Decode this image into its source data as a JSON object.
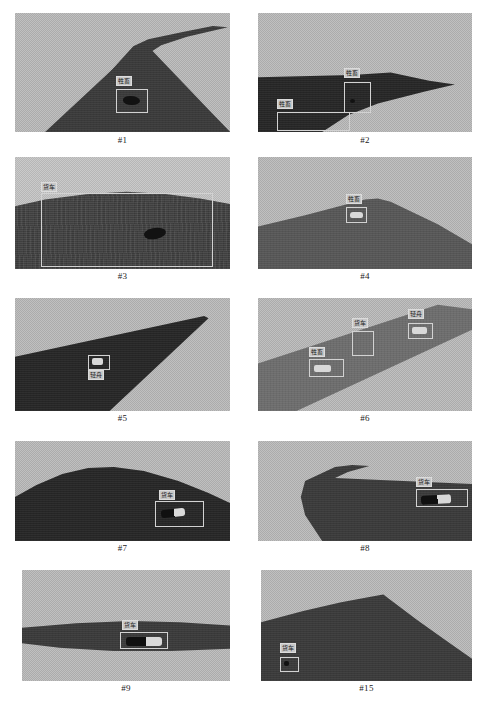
{
  "figure": {
    "columns": 2,
    "rows": 5,
    "label_classes": {
      "livestock": "牲畜",
      "truck": "货车",
      "light_boat": "轻舟"
    }
  },
  "panels": [
    {
      "id": "p1",
      "caption": "#1",
      "scene": "dark ridge silhouette against dithered gray sky",
      "detections": [
        {
          "label": "牲畜",
          "class": "livestock"
        }
      ]
    },
    {
      "id": "p2",
      "caption": "#2",
      "scene": "dark wedge-shaped landmass with pointed tip, gray sky",
      "detections": [
        {
          "label": "牲畜",
          "class": "livestock"
        },
        {
          "label": "牲畜",
          "class": "livestock"
        }
      ]
    },
    {
      "id": "p3",
      "caption": "#3",
      "scene": "textured water / rough dark field below a low horizon",
      "detections": [
        {
          "label": "货车",
          "class": "truck"
        }
      ]
    },
    {
      "id": "p4",
      "caption": "#4",
      "scene": "broad dark slope rising to a peak, light sky",
      "detections": [
        {
          "label": "牲畜",
          "class": "livestock"
        }
      ]
    },
    {
      "id": "p5",
      "caption": "#5",
      "scene": "long dark triangular wedge pointing to upper right",
      "detections": [
        {
          "label": "轻舟",
          "class": "light_boat"
        }
      ]
    },
    {
      "id": "p6",
      "caption": "#6",
      "scene": "diagonal gray band (road) crossing the frame",
      "detections": [
        {
          "label": "轻舟",
          "class": "light_boat"
        },
        {
          "label": "货车",
          "class": "truck"
        },
        {
          "label": "牲畜",
          "class": "livestock"
        }
      ]
    },
    {
      "id": "p7",
      "caption": "#7",
      "scene": "rounded dark hill against gray sky",
      "detections": [
        {
          "label": "货车",
          "class": "truck"
        }
      ]
    },
    {
      "id": "p8",
      "caption": "#8",
      "scene": "curved dark landmass with spur at upper left",
      "detections": [
        {
          "label": "货车",
          "class": "truck"
        }
      ]
    },
    {
      "id": "p9",
      "caption": "#9",
      "scene": "narrow horizontal dark band across a bright field",
      "detections": [
        {
          "label": "货车",
          "class": "truck"
        }
      ]
    },
    {
      "id": "p15",
      "caption": "#15",
      "scene": "dark peaked ridge filling the lower frame",
      "detections": [
        {
          "label": "货车",
          "class": "truck"
        }
      ]
    }
  ]
}
